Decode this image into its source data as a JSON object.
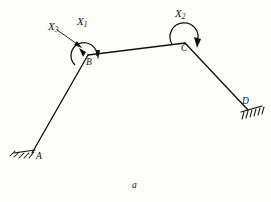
{
  "figure": {
    "caption": "a",
    "background_color": "#fdfdfb",
    "ink_color": "#111111",
    "nodes": [
      {
        "id": "A",
        "label": "A",
        "x": 32,
        "y": 153,
        "support": "fixed"
      },
      {
        "id": "B",
        "label": "B",
        "x": 88,
        "y": 55,
        "support": "none"
      },
      {
        "id": "C",
        "label": "C",
        "x": 185,
        "y": 43,
        "support": "none"
      },
      {
        "id": "D",
        "label": "D",
        "x": 248,
        "y": 110,
        "support": "fixed"
      }
    ],
    "members": [
      {
        "from": "A",
        "to": "B"
      },
      {
        "from": "B",
        "to": "C"
      },
      {
        "from": "C",
        "to": "D"
      }
    ],
    "forces": [
      {
        "id": "X1",
        "label": "X",
        "subscript": "1",
        "at_node": "B",
        "type": "moment-arc",
        "label_x": 77,
        "label_y": 16
      },
      {
        "id": "X2",
        "label": "X",
        "subscript": "2",
        "at_node": "C",
        "type": "moment-arc",
        "label_x": 175,
        "label_y": 8
      },
      {
        "id": "X3",
        "label": "X",
        "subscript": "3",
        "at_node": "B",
        "type": "leader-arrow",
        "label_x": 48,
        "label_y": 24
      }
    ],
    "supports": [
      {
        "at_node": "A",
        "type": "fixed-hatched",
        "hatch_count": 5
      },
      {
        "at_node": "D",
        "type": "fixed-hatched",
        "hatch_count": 6
      }
    ]
  }
}
